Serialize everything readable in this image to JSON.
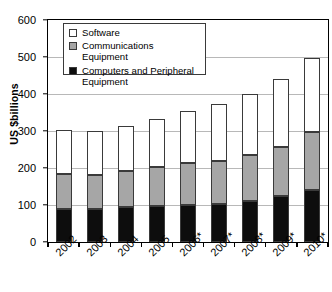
{
  "chart_data": {
    "type": "bar",
    "stacked": true,
    "title": "",
    "subtitle": "",
    "xlabel": "",
    "ylabel": "US $billions",
    "ylim": [
      0,
      600
    ],
    "yticks": [
      0,
      100,
      200,
      300,
      400,
      500,
      600
    ],
    "grid": true,
    "legend_position": "upper-left-inside",
    "categories": [
      "2002",
      "2003",
      "2004",
      "2005",
      "2006*",
      "2007*",
      "2008*",
      "2009*",
      "2010*"
    ],
    "series": [
      {
        "name": "Computers and Peripheral Equipment",
        "color": "#0d0d0d",
        "values": [
          90,
          90,
          94,
          98,
          100,
          104,
          112,
          124,
          141
        ]
      },
      {
        "name": "Communications Equipment",
        "color": "#a6a6a6",
        "values": [
          94,
          91,
          97,
          105,
          114,
          115,
          124,
          133,
          156
        ]
      },
      {
        "name": "Software",
        "color": "#ffffff",
        "values": [
          119,
          118,
          122,
          130,
          141,
          153,
          163,
          184,
          201
        ]
      }
    ],
    "cumulative_tops": {
      "computers": [
        90,
        90,
        94,
        98,
        100,
        104,
        112,
        124,
        141
      ],
      "communications": [
        184,
        181,
        191,
        203,
        214,
        219,
        236,
        257,
        297
      ],
      "total": [
        303,
        299,
        313,
        333,
        355,
        372,
        399,
        441,
        498
      ]
    }
  },
  "axes": {
    "y_title": "US $billions",
    "y_tick_labels": [
      "600",
      "500",
      "400",
      "300",
      "200",
      "100",
      "0"
    ],
    "x_tick_labels": [
      "2002",
      "2003",
      "2004",
      "2005",
      "2006*",
      "2007*",
      "2008*",
      "2009*",
      "2010*"
    ]
  },
  "legend": {
    "items": [
      {
        "label": "Software",
        "swatch": "white-square-icon"
      },
      {
        "label": "Communications Equipment",
        "swatch": "gray-square-icon"
      },
      {
        "label": "Computers and Peripheral Equipment",
        "swatch": "black-square-icon"
      }
    ]
  }
}
